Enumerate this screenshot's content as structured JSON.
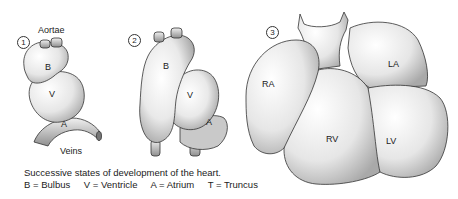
{
  "figure": {
    "caption": "Successive states of development of the heart.",
    "legend": [
      {
        "abbr": "B",
        "text": "B = Bulbus"
      },
      {
        "abbr": "V",
        "text": "V = Ventricle"
      },
      {
        "abbr": "A",
        "text": "A = Atrium"
      },
      {
        "abbr": "T",
        "text": "T = Truncus"
      }
    ],
    "stages": [
      {
        "number": "1",
        "labels": {
          "aortae": "Aortae",
          "bulbus": "B",
          "ventricle": "V",
          "atrium": "A",
          "veins": "Veins"
        }
      },
      {
        "number": "2",
        "labels": {
          "bulbus": "B",
          "ventricle": "V",
          "atrium": "A"
        }
      },
      {
        "number": "3",
        "labels": {
          "right_atrium": "RA",
          "left_atrium": "LA",
          "right_ventricle": "RV",
          "left_ventricle": "LV"
        }
      }
    ],
    "colors": {
      "ink": "#222222",
      "fill": "#f2f2f2",
      "shade": "#bdbdbd",
      "background": "#ffffff"
    }
  }
}
